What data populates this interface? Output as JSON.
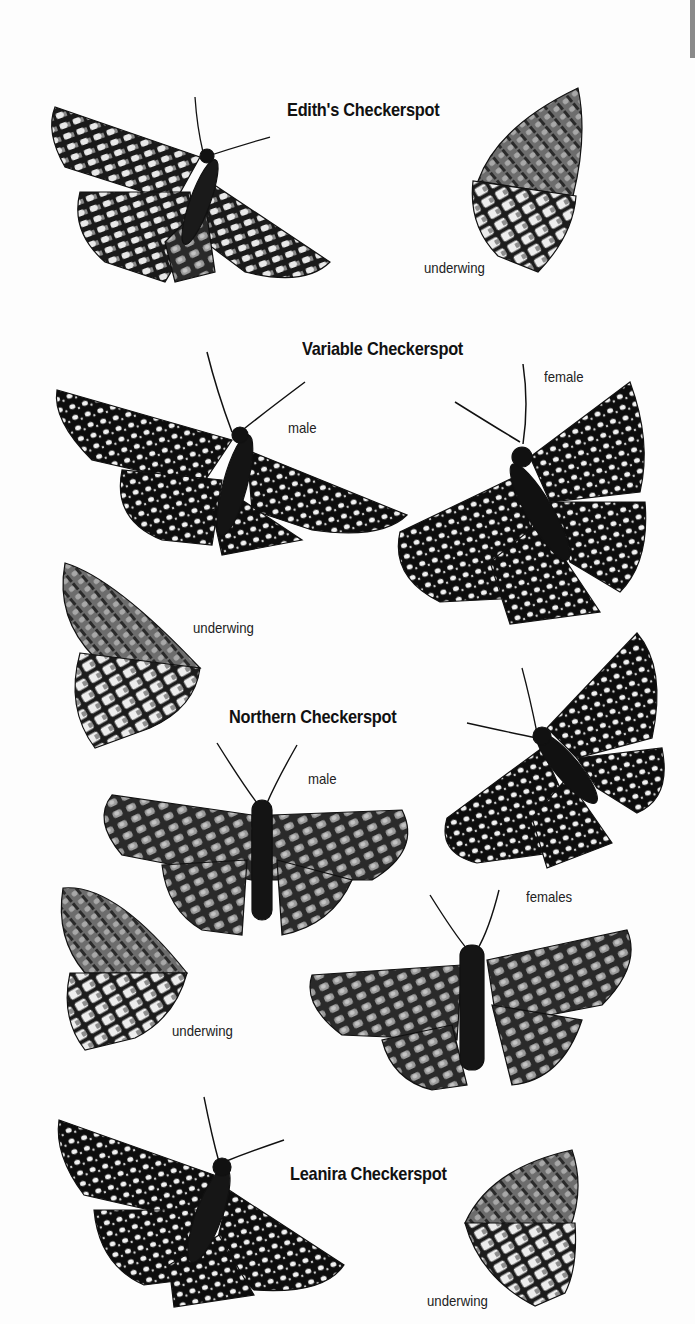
{
  "page": {
    "edge_tab_color": "#8a8a8a",
    "species": [
      {
        "name": "Edith's Checkerspot",
        "figures": [
          {
            "view": "dorsal",
            "caption": ""
          },
          {
            "view": "underwing",
            "caption": "underwing"
          }
        ]
      },
      {
        "name": "Variable Checkerspot",
        "figures": [
          {
            "view": "male",
            "caption": "male"
          },
          {
            "view": "female",
            "caption": "female"
          },
          {
            "view": "underwing",
            "caption": "underwing"
          }
        ]
      },
      {
        "name": "Northern Checkerspot",
        "figures": [
          {
            "view": "male",
            "caption": "male"
          },
          {
            "view": "female-dark",
            "caption": ""
          },
          {
            "view": "female",
            "caption": "females"
          },
          {
            "view": "underwing",
            "caption": "underwing"
          }
        ]
      },
      {
        "name": "Leanira Checkerspot",
        "figures": [
          {
            "view": "dorsal",
            "caption": ""
          },
          {
            "view": "underwing",
            "caption": "underwing"
          }
        ]
      }
    ]
  }
}
